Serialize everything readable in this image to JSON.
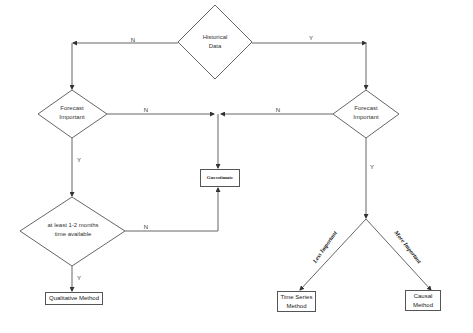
{
  "diagram": {
    "type": "flowchart",
    "nodes": {
      "historical_data": {
        "label_line1": "Historical",
        "label_line2": "Data",
        "shape": "diamond"
      },
      "forecast_left": {
        "label_line1": "Forecast",
        "label_line2": "Important",
        "shape": "diamond"
      },
      "forecast_right": {
        "label_line1": "Forecast",
        "label_line2": "Important",
        "shape": "diamond"
      },
      "time_available": {
        "label_line1": "at least 1-2 months",
        "label_line2": "time available",
        "shape": "diamond"
      },
      "guesstimate": {
        "label": "Guesstimate",
        "shape": "rectangle"
      },
      "qualitative": {
        "label": "Qualitative Method",
        "shape": "rectangle"
      },
      "time_series": {
        "label_line1": "Time Series",
        "label_line2": "Method",
        "shape": "rectangle"
      },
      "causal": {
        "label_line1": "Causal",
        "label_line2": "Method",
        "shape": "rectangle"
      }
    },
    "edges": {
      "hist_to_left": "N",
      "hist_to_right": "Y",
      "left_forecast_to_guess": "N",
      "right_forecast_to_guess": "N",
      "left_forecast_to_time": "Y",
      "time_to_guess": "N",
      "time_to_qualitative": "Y",
      "right_forecast_down": "Y",
      "to_time_series": "Less Important",
      "to_causal": "More Important"
    },
    "colors": {
      "line": "#555555",
      "background": "#ffffff",
      "text": "#333333"
    }
  }
}
